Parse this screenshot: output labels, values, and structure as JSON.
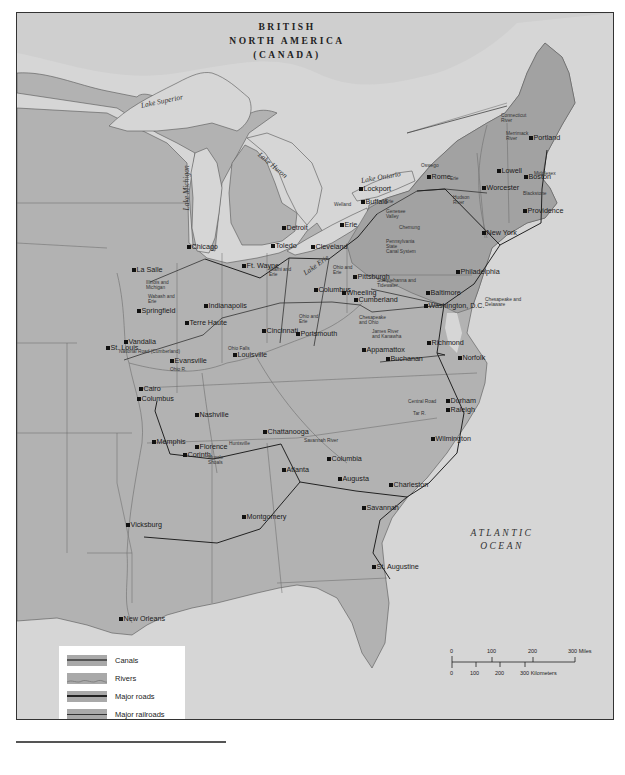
{
  "map": {
    "region_labels": {
      "canada": [
        "BRITISH",
        "NORTH AMERICA",
        "(CANADA)"
      ],
      "ocean": [
        "ATLANTIC",
        "OCEAN"
      ]
    },
    "water_labels": [
      {
        "id": "lake-superior",
        "text": "Lake Superior",
        "x": 140,
        "y": 100,
        "rot": -12
      },
      {
        "id": "lake-huron",
        "text": "Lake Huron",
        "x": 258,
        "y": 148,
        "rot": 40
      },
      {
        "id": "lake-michigan",
        "text": "Lake Michigan",
        "x": 185,
        "y": 205,
        "rot": -90
      },
      {
        "id": "lake-erie",
        "text": "Lake Erie",
        "x": 303,
        "y": 268,
        "rot": -35
      },
      {
        "id": "lake-ontario",
        "text": "Lake Ontario",
        "x": 360,
        "y": 175,
        "rot": -10
      }
    ],
    "cities": [
      {
        "name": "Portland",
        "x": 530,
        "y": 137
      },
      {
        "name": "Boston",
        "x": 525,
        "y": 176
      },
      {
        "name": "Lowell",
        "x": 498,
        "y": 170
      },
      {
        "name": "Worcester",
        "x": 483,
        "y": 187
      },
      {
        "name": "Providence",
        "x": 524,
        "y": 210
      },
      {
        "name": "New York",
        "x": 483,
        "y": 232
      },
      {
        "name": "Rome",
        "x": 428,
        "y": 176
      },
      {
        "name": "Lockport",
        "x": 360,
        "y": 188
      },
      {
        "name": "Buffalo",
        "x": 362,
        "y": 201
      },
      {
        "name": "Erie",
        "x": 341,
        "y": 224
      },
      {
        "name": "Cleveland",
        "x": 312,
        "y": 246
      },
      {
        "name": "Toledo",
        "x": 272,
        "y": 245
      },
      {
        "name": "Detroit",
        "x": 283,
        "y": 227
      },
      {
        "name": "Chicago",
        "x": 188,
        "y": 246
      },
      {
        "name": "La Salle",
        "x": 133,
        "y": 269
      },
      {
        "name": "Ft. Wayne",
        "x": 243,
        "y": 265
      },
      {
        "name": "Columbus",
        "x": 315,
        "y": 289
      },
      {
        "name": "Pittsburgh",
        "x": 354,
        "y": 276
      },
      {
        "name": "Wheeling",
        "x": 343,
        "y": 292
      },
      {
        "name": "Cumberland",
        "x": 355,
        "y": 299
      },
      {
        "name": "Philadelphia",
        "x": 457,
        "y": 271
      },
      {
        "name": "Baltimore",
        "x": 427,
        "y": 292
      },
      {
        "name": "Washington, D.C.",
        "x": 425,
        "y": 305
      },
      {
        "name": "Springfield",
        "x": 138,
        "y": 310
      },
      {
        "name": "Indianapolis",
        "x": 205,
        "y": 305
      },
      {
        "name": "Terre Haute",
        "x": 186,
        "y": 322
      },
      {
        "name": "Cincinnati",
        "x": 263,
        "y": 330
      },
      {
        "name": "Portsmouth",
        "x": 297,
        "y": 333
      },
      {
        "name": "Vandalia",
        "x": 125,
        "y": 341
      },
      {
        "name": "St. Louis",
        "x": 107,
        "y": 347
      },
      {
        "name": "Evansville",
        "x": 171,
        "y": 360
      },
      {
        "name": "Louisville",
        "x": 234,
        "y": 354
      },
      {
        "name": "Appamattox",
        "x": 363,
        "y": 349
      },
      {
        "name": "Buchanan",
        "x": 387,
        "y": 358
      },
      {
        "name": "Richmond",
        "x": 428,
        "y": 342
      },
      {
        "name": "Norfolk",
        "x": 459,
        "y": 357
      },
      {
        "name": "Cairo",
        "x": 140,
        "y": 388
      },
      {
        "name": "Columbus",
        "x": 138,
        "y": 398
      },
      {
        "name": "Nashville",
        "x": 196,
        "y": 414
      },
      {
        "name": "Durham",
        "x": 447,
        "y": 400
      },
      {
        "name": "Raleigh",
        "x": 447,
        "y": 409
      },
      {
        "name": "Wilmington",
        "x": 432,
        "y": 438
      },
      {
        "name": "Memphis",
        "x": 153,
        "y": 441
      },
      {
        "name": "Florence",
        "x": 196,
        "y": 446
      },
      {
        "name": "Corinth",
        "x": 184,
        "y": 454
      },
      {
        "name": "Chattanooga",
        "x": 264,
        "y": 431
      },
      {
        "name": "Columbia",
        "x": 328,
        "y": 458
      },
      {
        "name": "Atlanta",
        "x": 283,
        "y": 469
      },
      {
        "name": "Augusta",
        "x": 339,
        "y": 478
      },
      {
        "name": "Charleston",
        "x": 390,
        "y": 484
      },
      {
        "name": "Savannah",
        "x": 363,
        "y": 507
      },
      {
        "name": "Montgomery",
        "x": 243,
        "y": 516
      },
      {
        "name": "Vicksburg",
        "x": 127,
        "y": 524
      },
      {
        "name": "St. Augustine",
        "x": 373,
        "y": 566
      },
      {
        "name": "New Orleans",
        "x": 120,
        "y": 618
      }
    ],
    "route_labels": [
      {
        "text": "Connecticut\nRiver",
        "x": 500,
        "y": 112
      },
      {
        "text": "Merrimack\nRiver",
        "x": 505,
        "y": 130
      },
      {
        "text": "Middlesex",
        "x": 533,
        "y": 170
      },
      {
        "text": "Blackstone",
        "x": 522,
        "y": 190
      },
      {
        "text": "Oswego",
        "x": 420,
        "y": 162
      },
      {
        "text": "Erie",
        "x": 449,
        "y": 175
      },
      {
        "text": "Hudson\nRiver",
        "x": 452,
        "y": 194
      },
      {
        "text": "Welland",
        "x": 333,
        "y": 201
      },
      {
        "text": "Erie",
        "x": 384,
        "y": 198
      },
      {
        "text": "Genesee\nValley",
        "x": 385,
        "y": 208
      },
      {
        "text": "Chemung",
        "x": 398,
        "y": 224
      },
      {
        "text": "Pennsylvania\nState\nCanal System",
        "x": 385,
        "y": 238
      },
      {
        "text": "Susquehanna and\nTidewater",
        "x": 376,
        "y": 277
      },
      {
        "text": "Chesapeake and\nDelaware",
        "x": 484,
        "y": 296
      },
      {
        "text": "Ohio and\nErie",
        "x": 332,
        "y": 264
      },
      {
        "text": "Miami and\nErie",
        "x": 268,
        "y": 266
      },
      {
        "text": "Illinois and\nMichigan",
        "x": 145,
        "y": 279
      },
      {
        "text": "Wabash and\nErie",
        "x": 147,
        "y": 293
      },
      {
        "text": "Ohio and\nErie",
        "x": 298,
        "y": 313
      },
      {
        "text": "Chesapeake\nand Ohio",
        "x": 358,
        "y": 314
      },
      {
        "text": "James River\nand Kanawha",
        "x": 371,
        "y": 328
      },
      {
        "text": "National Road (Cumberland)",
        "x": 118,
        "y": 348
      },
      {
        "text": "Ohio Falls",
        "x": 227,
        "y": 345
      },
      {
        "text": "Ohio R.",
        "x": 169,
        "y": 366
      },
      {
        "text": "Huntsville",
        "x": 228,
        "y": 440
      },
      {
        "text": "Muscle\nShoals",
        "x": 207,
        "y": 454
      },
      {
        "text": "Savannah River",
        "x": 303,
        "y": 437
      },
      {
        "text": "Central Road",
        "x": 407,
        "y": 398
      },
      {
        "text": "Tar R.",
        "x": 412,
        "y": 410
      }
    ],
    "legend": {
      "items": [
        {
          "label": "Canals",
          "type": "canal"
        },
        {
          "label": "Rivers",
          "type": "river"
        },
        {
          "label": "Major roads",
          "type": "road"
        },
        {
          "label": "Major railroads",
          "type": "railroad"
        }
      ]
    },
    "scale_bar": {
      "miles": [
        "0",
        "100",
        "200",
        "300 Miles"
      ],
      "kilometers": [
        "0",
        "100",
        "200",
        "300 Kilometers"
      ]
    },
    "colors": {
      "water": "#d6d6d6",
      "land": "#b2b2b2",
      "highlight_states": "#a2a2a2",
      "canada": "#cfcfcf",
      "line": "#4a4a4a"
    }
  }
}
